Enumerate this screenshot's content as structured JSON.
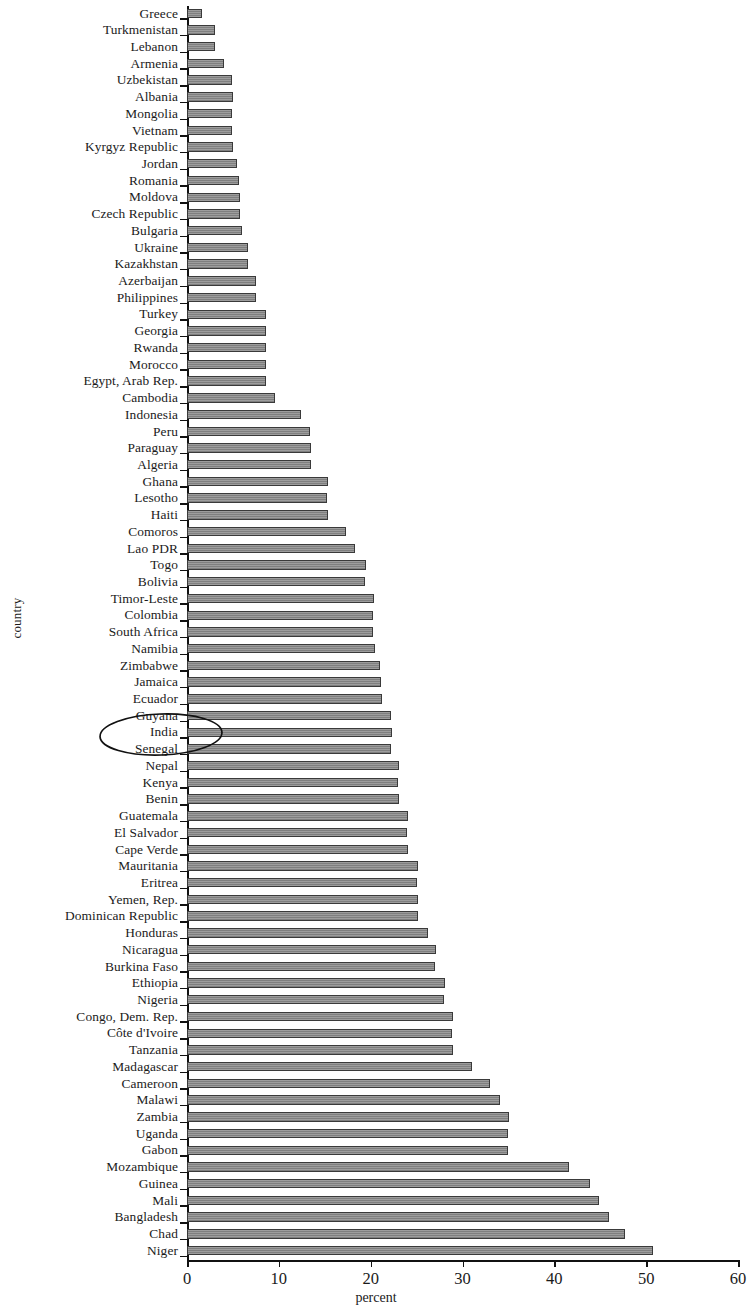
{
  "chart_data": {
    "type": "bar",
    "orientation": "horizontal",
    "title": "",
    "xlabel": "percent",
    "ylabel": "country",
    "xlim": [
      0,
      60
    ],
    "xticks": [
      0,
      10,
      20,
      30,
      40,
      50,
      60
    ],
    "grid": false,
    "legend": null,
    "bar_color": "#8d8d8d",
    "bar_edge_color": "#3a3a3a",
    "annotation": {
      "type": "hand-drawn-ellipse",
      "highlights": [
        "Guyana",
        "India",
        "Senegal"
      ]
    },
    "categories": [
      "Greece",
      "Turkmenistan",
      "Lebanon",
      "Armenia",
      "Uzbekistan",
      "Albania",
      "Mongolia",
      "Vietnam",
      "Kyrgyz Republic",
      "Jordan",
      "Romania",
      "Moldova",
      "Czech Republic",
      "Bulgaria",
      "Ukraine",
      "Kazakhstan",
      "Azerbaijan",
      "Philippines",
      "Turkey",
      "Georgia",
      "Rwanda",
      "Morocco",
      "Egypt, Arab Rep.",
      "Cambodia",
      "Indonesia",
      "Peru",
      "Paraguay",
      "Algeria",
      "Ghana",
      "Lesotho",
      "Haiti",
      "Comoros",
      "Lao PDR",
      "Togo",
      "Bolivia",
      "Timor-Leste",
      "Colombia",
      "South Africa",
      "Namibia",
      "Zimbabwe",
      "Jamaica",
      "Ecuador",
      "Guyana",
      "India",
      "Senegal",
      "Nepal",
      "Kenya",
      "Benin",
      "Guatemala",
      "El Salvador",
      "Cape Verde",
      "Mauritania",
      "Eritrea",
      "Yemen, Rep.",
      "Dominican Republic",
      "Honduras",
      "Nicaragua",
      "Burkina Faso",
      "Ethiopia",
      "Nigeria",
      "Congo, Dem. Rep.",
      "Côte d'Ivoire",
      "Tanzania",
      "Madagascar",
      "Cameroon",
      "Malawi",
      "Zambia",
      "Uganda",
      "Gabon",
      "Mozambique",
      "Guinea",
      "Mali",
      "Bangladesh",
      "Chad",
      "Niger"
    ],
    "values": [
      1.6,
      3.0,
      3.1,
      4.0,
      4.9,
      5.0,
      4.9,
      4.9,
      5.0,
      5.4,
      5.7,
      5.8,
      5.8,
      6.0,
      6.6,
      6.6,
      7.5,
      7.5,
      8.6,
      8.6,
      8.6,
      8.6,
      8.6,
      9.6,
      12.4,
      13.4,
      13.5,
      13.5,
      15.3,
      15.2,
      15.3,
      17.3,
      18.3,
      19.5,
      19.4,
      20.4,
      20.3,
      20.3,
      20.5,
      21.0,
      21.1,
      21.2,
      22.2,
      22.3,
      22.2,
      23.1,
      23.0,
      23.1,
      24.1,
      24.0,
      24.1,
      25.2,
      25.0,
      25.1,
      25.1,
      26.2,
      27.1,
      27.0,
      28.1,
      28.0,
      29.0,
      28.9,
      29.0,
      31.0,
      33.0,
      34.1,
      35.1,
      35.0,
      35.0,
      41.6,
      43.9,
      44.9,
      45.9,
      47.7,
      50.7
    ]
  }
}
